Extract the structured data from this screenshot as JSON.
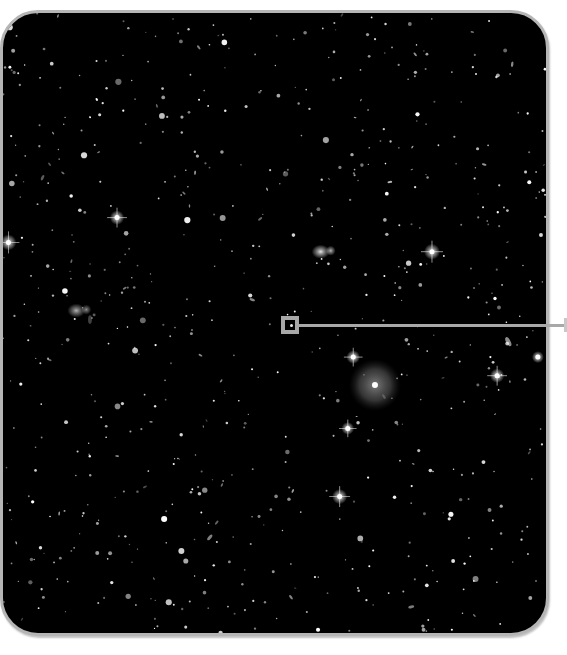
{
  "image": {
    "subject": "deep-field starfield with a magnified-region callout",
    "background_color": "#000000",
    "frame_color": "#b5b5b5",
    "callout_color": "#a8a8a8",
    "star_color": "#ffffff",
    "halo_color": "#8a8a8a"
  },
  "features": [
    {
      "name": "bright-star-left-edge",
      "kind": "spiked-star",
      "fx": 0.01,
      "fy": 0.37,
      "brightness": 1.0
    },
    {
      "name": "bright-star-upper-left",
      "kind": "spiked-star",
      "fx": 0.21,
      "fy": 0.33,
      "brightness": 0.9
    },
    {
      "name": "galaxy-pair-center",
      "kind": "galaxy",
      "fx": 0.585,
      "fy": 0.385,
      "brightness": 0.9
    },
    {
      "name": "bright-star-center-right",
      "kind": "spiked-star",
      "fx": 0.79,
      "fy": 0.385,
      "brightness": 1.0
    },
    {
      "name": "halo-galaxy",
      "kind": "halo",
      "fx": 0.685,
      "fy": 0.6,
      "brightness": 0.8
    },
    {
      "name": "bright-star-mid",
      "kind": "spiked-star",
      "fx": 0.645,
      "fy": 0.555,
      "brightness": 0.85
    },
    {
      "name": "bright-star-lower-mid",
      "kind": "spiked-star",
      "fx": 0.635,
      "fy": 0.67,
      "brightness": 0.8
    },
    {
      "name": "bright-star-lower-center",
      "kind": "spiked-star",
      "fx": 0.62,
      "fy": 0.78,
      "brightness": 0.95
    },
    {
      "name": "bright-star-right",
      "kind": "spiked-star",
      "fx": 0.91,
      "fy": 0.585,
      "brightness": 0.9
    },
    {
      "name": "edge-star-right",
      "kind": "star",
      "fx": 0.985,
      "fy": 0.555,
      "brightness": 0.9
    },
    {
      "name": "diffuse-galaxy-left",
      "kind": "galaxy",
      "fx": 0.135,
      "fy": 0.48,
      "brightness": 0.7
    }
  ],
  "starfield": {
    "count": 700,
    "seed": 42
  },
  "callout": {
    "target": "magnified-region-marker",
    "direction": "right"
  }
}
